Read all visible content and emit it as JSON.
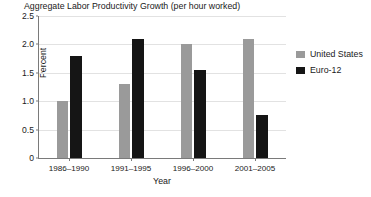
{
  "chart_data": {
    "type": "bar",
    "title": "Aggregate Labor Productivity Growth (per hour worked)",
    "xlabel": "Year",
    "ylabel": "Percent",
    "categories": [
      "1986–1990",
      "1991–1995",
      "1996–2000",
      "2001–2005"
    ],
    "series": [
      {
        "name": "United States",
        "color": "#9a9a9a",
        "values": [
          1.0,
          1.3,
          2.0,
          2.1
        ]
      },
      {
        "name": "Euro-12",
        "color": "#151515",
        "values": [
          1.8,
          2.1,
          1.55,
          0.75
        ]
      }
    ],
    "ylim": [
      0,
      2.5
    ],
    "ytick_labels": [
      "0",
      "0.5",
      "1.0",
      "1.5",
      "2.0",
      "2.5"
    ],
    "ytick_values": [
      0,
      0.5,
      1.0,
      1.5,
      2.0,
      2.5
    ],
    "grid": true,
    "grid_axis": "y",
    "legend_position": "right",
    "bar_group_mode": "grouped"
  },
  "figure": {
    "caption_fragment": ""
  }
}
